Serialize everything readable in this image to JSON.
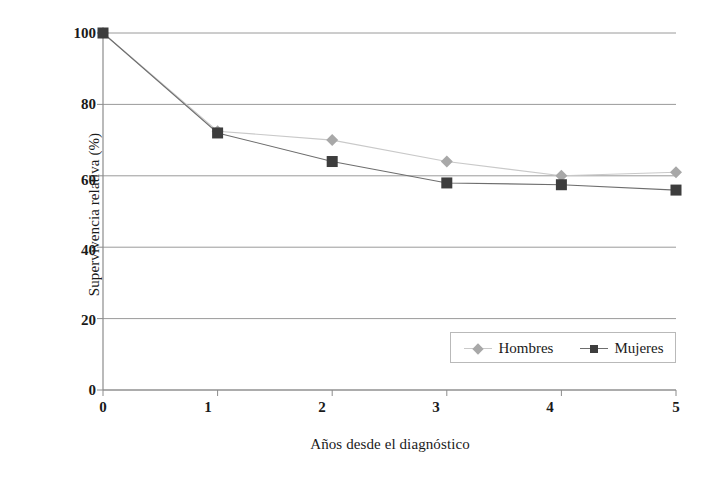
{
  "chart_data": {
    "type": "line",
    "title": "",
    "xlabel": "Años desde el diagnóstico",
    "ylabel": "Supervivencia relativa (%)",
    "x": [
      0,
      1,
      2,
      3,
      4,
      5
    ],
    "xticklabels": [
      "0",
      "1",
      "2",
      "3",
      "4",
      "5"
    ],
    "yticklabels": [
      "0",
      "20",
      "40",
      "60",
      "80",
      "100"
    ],
    "yticks": [
      0,
      20,
      40,
      60,
      80,
      100
    ],
    "xlim": [
      0,
      5
    ],
    "ylim": [
      0,
      100
    ],
    "grid": "horizontal",
    "legend_position": "lower-right-inside",
    "series": [
      {
        "name": "Hombres",
        "marker": "diamond",
        "color": "#a8a8a8",
        "line_color": "#c9c9c9",
        "values": [
          100,
          72.5,
          70,
          64,
          60,
          61
        ]
      },
      {
        "name": "Mujeres",
        "marker": "square",
        "color": "#3d3d3d",
        "line_color": "#6e6e6e",
        "values": [
          100,
          72,
          64,
          58,
          57.5,
          56
        ]
      }
    ]
  },
  "axes": {
    "ylabel": "Supervivencia relativa (%)",
    "xlabel": "Años desde el diagnóstico",
    "yticks": [
      "100",
      "80",
      "60",
      "40",
      "20",
      "0"
    ],
    "xticks": [
      "0",
      "1",
      "2",
      "3",
      "4",
      "5"
    ]
  },
  "legend": {
    "entries": [
      {
        "label": "Hombres",
        "marker": "diamond-marker-icon",
        "color": "#a8a8a8"
      },
      {
        "label": "Mujeres",
        "marker": "square-marker-icon",
        "color": "#3d3d3d"
      }
    ]
  }
}
